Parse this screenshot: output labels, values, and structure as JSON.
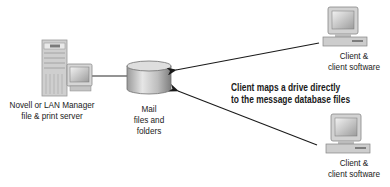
{
  "diagram": {
    "server": {
      "icon": "server-tower-with-monitor-icon",
      "label_line1": "Novell or LAN Manager",
      "label_line2": "file & print server"
    },
    "storage": {
      "icon": "database-cylinder-icon",
      "label_line1": "Mail",
      "label_line2": "files and",
      "label_line3": "folders"
    },
    "client_top": {
      "icon": "desktop-computer-icon",
      "label_line1": "Client &",
      "label_line2": "client software"
    },
    "client_bottom": {
      "icon": "desktop-computer-icon",
      "label_line1": "Client &",
      "label_line2": "client software"
    },
    "annotation": {
      "line1": "Client maps a drive directly",
      "line2": "to the message database files"
    },
    "connections": [
      {
        "from": "server",
        "to": "storage",
        "type": "line"
      },
      {
        "from": "client_top",
        "to": "storage",
        "type": "arrow"
      },
      {
        "from": "client_bottom",
        "to": "storage",
        "type": "arrow"
      }
    ]
  }
}
